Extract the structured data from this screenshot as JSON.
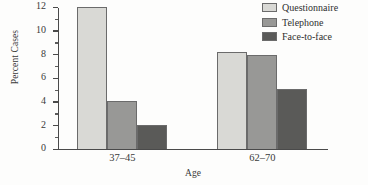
{
  "chart_data": {
    "type": "bar",
    "title": "",
    "subtitle": "",
    "xlabel": "Age",
    "ylabel": "Percent Cases",
    "categories": [
      "37–45",
      "62–70"
    ],
    "series": [
      {
        "name": "Questionnaire",
        "values": [
          12.0,
          8.2
        ],
        "color": "#d9d9d5"
      },
      {
        "name": "Telephone",
        "values": [
          4.0,
          7.9
        ],
        "color": "#989896"
      },
      {
        "name": "Face-to-face",
        "values": [
          2.0,
          5.0
        ],
        "color": "#5a5a58"
      }
    ],
    "ylim": [
      0,
      12
    ],
    "yticks": [
      0,
      2,
      4,
      6,
      8,
      10,
      12
    ],
    "yticklabels": [
      "0",
      "2",
      "4",
      "6",
      "8",
      "10",
      "12"
    ],
    "yminorticks": [
      1,
      3,
      5,
      7,
      9,
      11
    ],
    "grid": false,
    "legend_position": "top-right",
    "annotations": []
  },
  "legend": {
    "items": [
      {
        "label": "Questionnaire"
      },
      {
        "label": "Telephone"
      },
      {
        "label": "Face-to-face"
      }
    ]
  }
}
